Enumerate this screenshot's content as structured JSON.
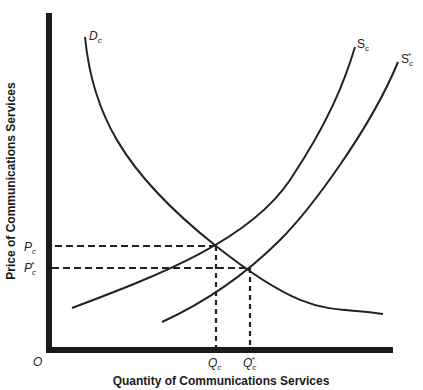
{
  "diagram": {
    "type": "supply-demand",
    "x_axis_title": "Quantity of Communications Services",
    "y_axis_title": "Price of Communications Services",
    "origin_label": "O",
    "curves": [
      {
        "id": "demand",
        "name": "D",
        "sub": "c",
        "star": ""
      },
      {
        "id": "supply",
        "name": "S",
        "sub": "c",
        "star": ""
      },
      {
        "id": "supply-shifted",
        "name": "S",
        "sub": "c",
        "star": "*"
      }
    ],
    "price_labels": [
      {
        "name": "P",
        "sub": "c",
        "star": ""
      },
      {
        "name": "P",
        "sub": "c",
        "star": "*"
      }
    ],
    "quantity_labels": [
      {
        "name": "Q",
        "sub": "c",
        "star": ""
      },
      {
        "name": "Q",
        "sub": "c",
        "star": "*"
      }
    ],
    "equilibria": [
      {
        "label": "original",
        "price": "Pc",
        "quantity": "Qc"
      },
      {
        "label": "new",
        "price": "Pc*",
        "quantity": "Qc*"
      }
    ],
    "colors": {
      "line": "#222222",
      "background": "#ffffff"
    }
  }
}
